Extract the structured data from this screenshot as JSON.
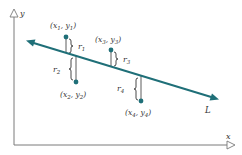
{
  "diagram": {
    "type": "linear-regression-residuals",
    "axes": {
      "x_label": "x",
      "y_label": "y",
      "color": "#7a7a7a"
    },
    "line": {
      "label": "L",
      "color": "#1f6f78",
      "start": [
        27,
        41
      ],
      "end": [
        218,
        99
      ]
    },
    "points": [
      {
        "id": 1,
        "label_x": "x",
        "label_y": "y",
        "sub": "1",
        "residual": "r",
        "residual_sub": "1",
        "pos": [
          66,
          37
        ],
        "foot_y": 53
      },
      {
        "id": 2,
        "label_x": "x",
        "label_y": "y",
        "sub": "2",
        "residual": "r",
        "residual_sub": "2",
        "pos": [
          76,
          82
        ],
        "foot_y": 56
      },
      {
        "id": 3,
        "label_x": "x",
        "label_y": "y",
        "sub": "3",
        "residual": "r",
        "residual_sub": "3",
        "pos": [
          111,
          50
        ],
        "foot_y": 66.5
      },
      {
        "id": 4,
        "label_x": "x",
        "label_y": "y",
        "sub": "4",
        "residual": "r",
        "residual_sub": "4",
        "pos": [
          141,
          101
        ],
        "foot_y": 75.5
      }
    ],
    "colors": {
      "point": "#1f6f78",
      "residual_line": "#333333",
      "brace": "#333333"
    }
  }
}
